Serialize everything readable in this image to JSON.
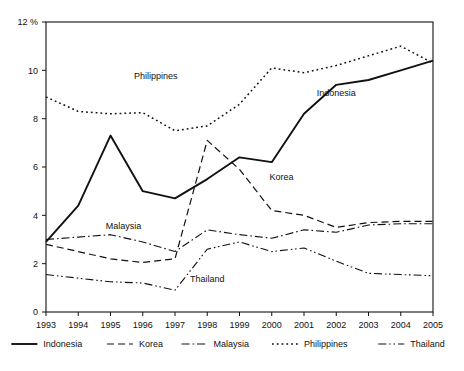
{
  "chart_data": {
    "type": "line",
    "title": "",
    "xlabel": "",
    "ylabel": "",
    "y_unit_label": "12 %",
    "ylim": [
      0,
      12
    ],
    "y_ticks": [
      0,
      2,
      4,
      6,
      8,
      10,
      12
    ],
    "y_tick_labels": [
      "0",
      "2",
      "4",
      "6",
      "8",
      "10",
      "12 %"
    ],
    "grid": false,
    "legend_position": "bottom",
    "x": [
      1993,
      1994,
      1995,
      1996,
      1997,
      1998,
      1999,
      2000,
      2001,
      2002,
      2003,
      2004,
      2005
    ],
    "categories": [
      "1993",
      "1994",
      "1995",
      "1996",
      "1997",
      "1998",
      "1999",
      "2000",
      "2001",
      "2002",
      "2003",
      "2004",
      "2005"
    ],
    "series": [
      {
        "name": "Indonesia",
        "style": "solid",
        "color": "#111111",
        "values": [
          2.9,
          4.4,
          7.3,
          5.0,
          4.7,
          5.5,
          6.4,
          6.2,
          8.2,
          9.4,
          9.6,
          10.0,
          10.4
        ]
      },
      {
        "name": "Korea",
        "style": "dashed",
        "color": "#111111",
        "values": [
          2.8,
          2.5,
          2.2,
          2.05,
          2.2,
          7.1,
          5.9,
          4.2,
          4.0,
          3.5,
          3.7,
          3.75,
          3.75
        ]
      },
      {
        "name": "Malaysia",
        "style": "dash-dot",
        "color": "#111111",
        "values": [
          3.0,
          3.1,
          3.2,
          2.9,
          2.5,
          3.4,
          3.2,
          3.05,
          3.4,
          3.3,
          3.6,
          3.65,
          3.65
        ]
      },
      {
        "name": "Philippines",
        "style": "dotted",
        "color": "#111111",
        "values": [
          8.9,
          8.3,
          8.2,
          8.25,
          7.5,
          7.7,
          8.6,
          10.1,
          9.9,
          10.2,
          10.6,
          11.0,
          10.3
        ]
      },
      {
        "name": "Thailand",
        "style": "dash-dot-dot",
        "color": "#111111",
        "values": [
          1.55,
          1.4,
          1.25,
          1.2,
          0.9,
          2.6,
          2.9,
          2.5,
          2.65,
          2.1,
          1.6,
          1.55,
          1.5
        ]
      }
    ],
    "inline_labels": [
      {
        "text": "Philippines",
        "x": 1996.4,
        "y": 9.65
      },
      {
        "text": "Indonesia",
        "x": 2002.0,
        "y": 8.95
      },
      {
        "text": "Korea",
        "x": 2000.3,
        "y": 5.45
      },
      {
        "text": "Malaysia",
        "x": 1995.4,
        "y": 3.45
      },
      {
        "text": "Thailand",
        "x": 1998.0,
        "y": 1.25
      }
    ],
    "legend": [
      {
        "label": "Indonesia",
        "style": "solid"
      },
      {
        "label": "Korea",
        "style": "dashed"
      },
      {
        "label": "Malaysia",
        "style": "dash-dot"
      },
      {
        "label": "Philippines",
        "style": "dotted"
      },
      {
        "label": "Thailand",
        "style": "dash-dot-dot"
      }
    ]
  }
}
